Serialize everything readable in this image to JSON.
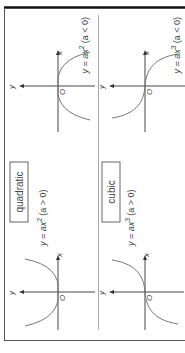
{
  "diagram": {
    "orientation": "rotated-90-clockwise",
    "colors": {
      "border": "#111111",
      "divider": "#999999",
      "axis": "#333333",
      "curve": "#777777",
      "text": "#444444",
      "label_box": "#666666"
    },
    "panels": [
      {
        "label": "quadratic",
        "graphs": [
          {
            "equation": "y = ax",
            "exponent": "2",
            "condition": "(a > 0)",
            "axis_x": "x",
            "axis_y": "y",
            "origin": "O"
          },
          {
            "equation": "y = ax",
            "exponent": "2",
            "condition": "(a < 0)",
            "axis_x": "x",
            "axis_y": "y",
            "origin": "O"
          }
        ]
      },
      {
        "label": "cubic",
        "graphs": [
          {
            "equation": "y = ax",
            "exponent": "3",
            "condition": "(a > 0)",
            "axis_x": "x",
            "axis_y": "y",
            "origin": "O"
          },
          {
            "equation": "y = ax",
            "exponent": "3",
            "condition": "(a < 0)",
            "axis_x": "x",
            "axis_y": "y",
            "origin": "O"
          }
        ]
      }
    ]
  }
}
